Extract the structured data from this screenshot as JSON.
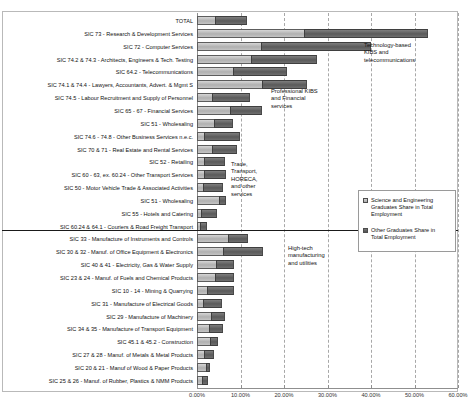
{
  "chart_data": {
    "type": "bar",
    "orientation": "horizontal",
    "stacked": true,
    "title": "",
    "xlabel": "",
    "ylabel": "",
    "xlim": [
      0,
      60
    ],
    "xticks": [
      "0.00%",
      "10.00%",
      "20.00%",
      "30.00%",
      "40.00%",
      "50.00%",
      "60.00%"
    ],
    "xtick_values": [
      0,
      10,
      20,
      30,
      40,
      50,
      60
    ],
    "grid": true,
    "legend_position": "right-middle",
    "series": [
      {
        "name": "Science and Engineering Graduates Share in Total Employment",
        "color": "#b8b8b8",
        "values": [
          4.2,
          24.5,
          14.6,
          12.3,
          8.3,
          14.9,
          3.5,
          7.6,
          3.8,
          1.7,
          3.4,
          1.5,
          1.6,
          1.3,
          5.0,
          1.0,
          0.6,
          7.1,
          5.9,
          4.4,
          4.2,
          2.4,
          1.4,
          3.3,
          2.7,
          3.0,
          1.5,
          2.0,
          1.1
        ]
      },
      {
        "name": "Other Graduates Share in Total Employment",
        "color": "#5f5f5f",
        "values": [
          7.2,
          28.6,
          25.3,
          15.3,
          12.5,
          10.4,
          8.8,
          7.4,
          4.4,
          8.2,
          5.8,
          5.0,
          5.1,
          4.6,
          1.6,
          3.5,
          1.8,
          4.6,
          9.3,
          4.2,
          4.2,
          6.1,
          4.4,
          3.2,
          3.3,
          1.9,
          2.5,
          1.0,
          1.5
        ]
      }
    ],
    "categories": [
      "TOTAL",
      "SIC 73 - Research & Development Services",
      "SIC 72 - Computer Services",
      "SIC 74.2 & 74.3 - Architects, Engineers & Tech. Testing",
      "SIC 64.2 - Telecommunications",
      "SIC 74.1 & 74.4 - Lawyers, Accountants, Advert. & Mgmt S",
      "SIC 74.5 - Labour Recruitment and Supply of Personnel",
      "SIC 65 - 67 - Financial Services",
      "SIC 51 - Wholesaling",
      "SIC 74.6 - 74.8 - Other Business Services n.e.c.",
      "SIC 70 & 71 - Real Estate and Rental Services",
      "SIC 52 - Retailing",
      "SIC 60 - 63, ex. 60.24 - Other Transport Services",
      "SIC 50 - Motor Vehicle Trade & Associated Activities",
      "SIC 51 - Wholesaling",
      "SIC 55 - Hotels and Catering",
      "SIC 60.24 & 64.1 - Couriers & Road Freight Transport",
      "SIC 33 - Manufacture of Instruments and Controls",
      "SIC 30 & 32 - Manuf. of Office Equipment & Electronics",
      "SIC 40 & 41 - Electricity, Gas & Water Supply",
      "SIC 23 & 24 - Manuf. of Fuels and Chemical Products",
      "SIC 10 - 14 - Mining & Quarrying",
      "SIC 31 - Manufacture of Electrical Goods",
      "SIC 29 - Manufacture of Machinery",
      "SIC 34 & 35 - Manufacture of Transport Equipment",
      "SIC 45.1 & 45.2 - Construction",
      "SIC 27 & 28 - Manuf. of Metals & Metal Products",
      "SIC 20 & 21 - Manuf of Wood & Paper Products",
      "SIC 25 & 26 - Manuf. of Rubber, Plastics & NMM Products"
    ],
    "annotations": [
      {
        "text": "Technology-based\nKIBS and\ntelecommunications",
        "x": 364,
        "y": 42
      },
      {
        "text": "Professional KIBS\nand Financial\nservices",
        "x": 271,
        "y": 88
      },
      {
        "text": "Trade,\nTransport,\nHORECA,\nand other\nservices",
        "x": 231,
        "y": 161
      },
      {
        "text": "High-tech\nmanufacturing\nand utilities",
        "x": 288,
        "y": 245
      }
    ]
  },
  "legend": {
    "items": [
      {
        "label": "Science and Engineering\nGraduates Share in Total\nEmployment",
        "swatch": "se"
      },
      {
        "label": "Other Graduates Share in\nTotal Employment",
        "swatch": "other"
      }
    ]
  }
}
